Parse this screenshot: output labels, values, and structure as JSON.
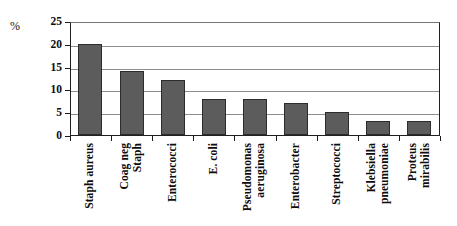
{
  "chart_data": {
    "type": "bar",
    "title": "",
    "xlabel": "",
    "ylabel": "%",
    "ylim": [
      0,
      25
    ],
    "ytick_labels": [
      "25",
      "20",
      "15",
      "10",
      "5",
      "0"
    ],
    "yticks": [
      25,
      20,
      15,
      10,
      5,
      0
    ],
    "grid": true,
    "legend": false,
    "bar_color": "#5c5c5c",
    "bar_border_color": "#2c2c2c",
    "categories": [
      "Staph aureus",
      "Coag neg Staph",
      "Enterococci",
      "E. coli",
      "Pseudomonas aeruginosa",
      "Enterobacter",
      "Streptococci",
      "Klebsiella pneumoniae",
      "Proteus mirabilis"
    ],
    "category_label_lines": [
      [
        "Staph aureus"
      ],
      [
        "Coag neg",
        "Staph"
      ],
      [
        "Enterococci"
      ],
      [
        "E. coli"
      ],
      [
        "Pseudomonas",
        "aeruginosa"
      ],
      [
        "Enterobacter"
      ],
      [
        "Streptococci"
      ],
      [
        "Klebsiella",
        "pneumoniae"
      ],
      [
        "Proteus",
        "mirabilis"
      ]
    ],
    "values": [
      20,
      14,
      12,
      8,
      8,
      7,
      5,
      3,
      3
    ]
  }
}
